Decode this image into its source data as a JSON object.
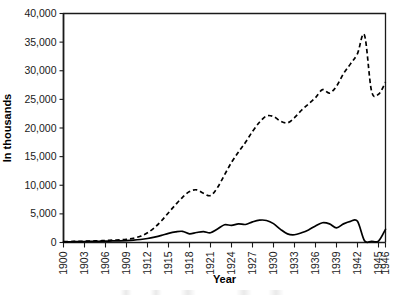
{
  "chart_data": {
    "type": "line",
    "title": "",
    "xlabel": "Year",
    "ylabel": "In thousands",
    "xlim": [
      1900,
      1946
    ],
    "ylim": [
      0,
      40000
    ],
    "grid": false,
    "legend_position": "none",
    "y_ticks": [
      0,
      5000,
      10000,
      15000,
      20000,
      25000,
      30000,
      35000,
      40000
    ],
    "y_tick_labels": [
      "0",
      "5,000",
      "10,000",
      "15,000",
      "20,000",
      "25,000",
      "30,000",
      "35,000",
      "40,000"
    ],
    "x_ticks": [
      1900,
      1903,
      1906,
      1909,
      1912,
      1915,
      1918,
      1921,
      1924,
      1927,
      1930,
      1933,
      1936,
      1939,
      1942,
      1945,
      1946
    ],
    "x_tick_labels": [
      "1900",
      "1903",
      "1906",
      "1909",
      "1912",
      "1915",
      "1918",
      "1921",
      "1924",
      "1927",
      "1930",
      "1933",
      "1936",
      "1939",
      "1942",
      "1945",
      "1946"
    ],
    "x": [
      1900,
      1901,
      1902,
      1903,
      1904,
      1905,
      1906,
      1907,
      1908,
      1909,
      1910,
      1911,
      1912,
      1913,
      1914,
      1915,
      1916,
      1917,
      1918,
      1919,
      1920,
      1921,
      1922,
      1923,
      1924,
      1925,
      1926,
      1927,
      1928,
      1929,
      1930,
      1931,
      1932,
      1933,
      1934,
      1935,
      1936,
      1937,
      1938,
      1939,
      1940,
      1941,
      1942,
      1943,
      1944,
      1945,
      1946
    ],
    "series": [
      {
        "name": "solid-series",
        "style": "solid",
        "values": [
          120,
          130,
          150,
          170,
          190,
          210,
          240,
          270,
          290,
          330,
          400,
          520,
          700,
          950,
          1250,
          1600,
          1850,
          1950,
          1500,
          1750,
          1900,
          1700,
          2350,
          3100,
          3000,
          3250,
          3150,
          3600,
          3900,
          3850,
          3300,
          2300,
          1500,
          1350,
          1700,
          2200,
          2900,
          3450,
          3250,
          2550,
          3250,
          3700,
          3700,
          300,
          200,
          250,
          2300
        ]
      },
      {
        "name": "dashed-series",
        "style": "dashed",
        "values": [
          150,
          170,
          190,
          220,
          250,
          290,
          340,
          400,
          470,
          560,
          750,
          1100,
          1700,
          2600,
          3800,
          5200,
          6600,
          7900,
          8900,
          9200,
          8600,
          8200,
          9600,
          11800,
          14000,
          15800,
          17500,
          19400,
          21000,
          22100,
          22000,
          21200,
          20900,
          21800,
          23100,
          24200,
          25300,
          26700,
          26100,
          27300,
          29500,
          31200,
          33000,
          36200,
          26500,
          25900,
          28000
        ]
      }
    ]
  }
}
